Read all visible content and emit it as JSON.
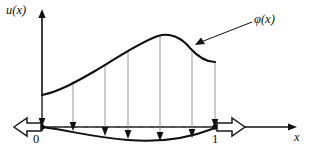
{
  "figure": {
    "background_color": "#ffffff",
    "ink_color": "#111111",
    "guide_color": "#8d8d8d"
  },
  "axes": {
    "y_label": "u(x)",
    "x_label": "x",
    "origin_label": "0",
    "unit_label": "1",
    "x_axis_y": 127,
    "y_axis_x": 42,
    "x_axis_start": 16,
    "x_axis_end": 297,
    "y_axis_top": 10,
    "y_axis_bottom": 131
  },
  "curves": {
    "phi_label": "φ(x)",
    "phi_path": "M 42 95 C 58 92 76 82 95 71 C 116 59 136 44 158 36 C 170 32 182 38 190 48 C 199 58 206 62 215 62",
    "phi_left_x": 42,
    "phi_left_y": 95,
    "phi_peak_x": 160,
    "phi_peak_y": 35,
    "phi_right_x": 215,
    "phi_right_y": 62,
    "displaced_path": "M 42 127 C 72 131 92 137 128 140 C 162 143 192 137 215 128",
    "displaced_min_x": 150,
    "displaced_min_y": 141
  },
  "drop_lines": {
    "description": "vertical mapping arrows from phi(x) down to the displaced boundary",
    "arrows": [
      {
        "x": 42,
        "top": 95,
        "bottom": 127
      },
      {
        "x": 73,
        "top": 81,
        "bottom": 131
      },
      {
        "x": 105,
        "top": 64,
        "bottom": 136
      },
      {
        "x": 128,
        "top": 50,
        "bottom": 139
      },
      {
        "x": 160,
        "top": 35,
        "bottom": 141
      },
      {
        "x": 192,
        "top": 50,
        "bottom": 138
      },
      {
        "x": 215,
        "top": 62,
        "bottom": 128
      }
    ]
  },
  "dashed_segments": {
    "y": 127,
    "spans": [
      {
        "x1": 46,
        "x2": 70
      },
      {
        "x1": 77,
        "x2": 102
      },
      {
        "x1": 109,
        "x2": 125
      },
      {
        "x1": 132,
        "x2": 157
      },
      {
        "x1": 164,
        "x2": 189
      },
      {
        "x1": 196,
        "x2": 212
      }
    ]
  },
  "nodes": [
    {
      "name": "left-endpoint",
      "x": 42,
      "y": 127,
      "label": "0"
    },
    {
      "name": "right-endpoint",
      "x": 215,
      "y": 127,
      "label": "1"
    }
  ],
  "block_arrows": [
    {
      "name": "left-block-arrow",
      "direction": "left",
      "tip_x": 14,
      "tail_x": 40,
      "y": 127
    },
    {
      "name": "right-block-arrow",
      "direction": "right",
      "tip_x": 245,
      "tail_x": 217,
      "y": 127
    }
  ],
  "annotation": {
    "leader_from_x": 252,
    "leader_from_y": 22,
    "leader_to_x": 196,
    "leader_to_y": 45
  }
}
